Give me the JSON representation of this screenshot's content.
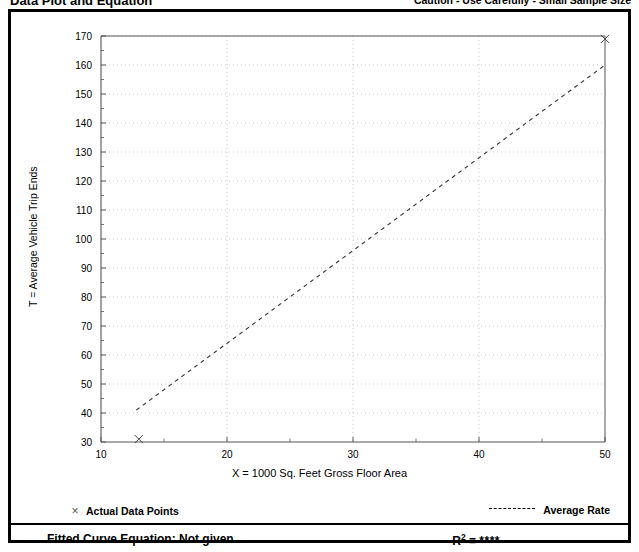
{
  "header": {
    "title": "Data Plot and Equation",
    "caution": "Caution - Use Carefully - Small Sample Size"
  },
  "legend": {
    "points_marker": "×",
    "points_label": "Actual Data Points",
    "rate_label": "Average Rate"
  },
  "equation": {
    "fitted_label": "Fitted Curve Equation:  Not given",
    "r2_prefix": "R",
    "r2_exponent": "2",
    "r2_equals": " = ",
    "r2_value": "****"
  },
  "colors": {
    "frame": "#000000",
    "axis": "#555555",
    "grid": "#bbbbbb",
    "series": "#333333"
  },
  "chart_data": {
    "type": "scatter",
    "title": "Data Plot and Equation",
    "xlabel": "X = 1000 Sq. Feet Gross Floor Area",
    "ylabel": "T = Average Vehicle Trip Ends",
    "xlim": [
      10,
      50
    ],
    "ylim": [
      30,
      170
    ],
    "xticks": [
      10,
      20,
      30,
      40,
      50
    ],
    "xtick_labels": [
      "10",
      "20",
      "30",
      "40",
      "50"
    ],
    "xminor_step": 5,
    "yticks": [
      30,
      40,
      50,
      60,
      70,
      80,
      90,
      100,
      110,
      120,
      130,
      140,
      150,
      160,
      170
    ],
    "ytick_labels": [
      "30",
      "40",
      "50",
      "60",
      "70",
      "80",
      "90",
      "100",
      "110",
      "120",
      "130",
      "140",
      "150",
      "160",
      "170"
    ],
    "grid": "dotted-major",
    "legend_position": "below-plot",
    "series": [
      {
        "name": "Actual Data Points",
        "type": "scatter",
        "marker": "x",
        "points": [
          {
            "x": 13.0,
            "y": 31.0
          },
          {
            "x": 50.0,
            "y": 169.0
          }
        ]
      },
      {
        "name": "Average Rate",
        "type": "line",
        "style": "dashed",
        "points": [
          {
            "x": 12.8,
            "y": 41.0
          },
          {
            "x": 50.0,
            "y": 160.0
          }
        ]
      }
    ],
    "annotations": [
      "Caution - Use Carefully - Small Sample Size",
      "Fitted Curve Equation:  Not given",
      "R2 = ****"
    ]
  }
}
